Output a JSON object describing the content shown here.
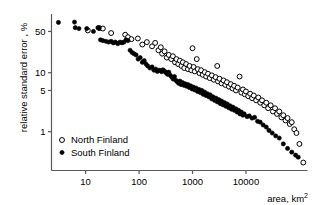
{
  "chart_data": {
    "type": "scatter",
    "title": "",
    "xlabel": "area, km2",
    "xlabel_display": "area, km²",
    "ylabel": "relative standard error , %",
    "xscale": "log",
    "yscale": "log",
    "xlim": [
      2.3,
      130000
    ],
    "ylim": [
      0.22,
      95
    ],
    "xticks": [
      10,
      100,
      1000,
      10000
    ],
    "xticklabels": [
      "10",
      "100",
      "1000",
      "10000"
    ],
    "yticks": [
      1,
      5,
      10,
      50
    ],
    "yticklabels": [
      "1",
      "5",
      "10",
      "50"
    ],
    "grid": false,
    "legend_position": "lower-left-inside",
    "series": [
      {
        "name": "North Finland",
        "marker": "open-circle",
        "color": "#000000",
        "fill": "#ffffff",
        "points": [
          [
            11,
            52
          ],
          [
            18,
            57
          ],
          [
            21,
            56
          ],
          [
            30,
            47
          ],
          [
            55,
            44
          ],
          [
            62,
            40
          ],
          [
            72,
            37
          ],
          [
            95,
            38
          ],
          [
            115,
            30
          ],
          [
            140,
            33
          ],
          [
            175,
            28
          ],
          [
            200,
            32
          ],
          [
            230,
            24
          ],
          [
            255,
            27
          ],
          [
            270,
            21
          ],
          [
            300,
            23
          ],
          [
            330,
            18
          ],
          [
            360,
            20
          ],
          [
            400,
            17
          ],
          [
            430,
            19
          ],
          [
            470,
            15
          ],
          [
            500,
            17
          ],
          [
            540,
            14
          ],
          [
            580,
            16
          ],
          [
            620,
            13
          ],
          [
            660,
            15
          ],
          [
            700,
            12
          ],
          [
            760,
            14
          ],
          [
            820,
            11.5
          ],
          [
            880,
            13
          ],
          [
            950,
            11
          ],
          [
            1000,
            26
          ],
          [
            1050,
            12.5
          ],
          [
            1100,
            10.5
          ],
          [
            1200,
            17
          ],
          [
            1250,
            11.5
          ],
          [
            1350,
            9.8
          ],
          [
            1450,
            11
          ],
          [
            1550,
            9.2
          ],
          [
            1700,
            10.2
          ],
          [
            1800,
            8.6
          ],
          [
            1950,
            9.6
          ],
          [
            2100,
            8.1
          ],
          [
            2300,
            9.0
          ],
          [
            2500,
            7.6
          ],
          [
            2700,
            8.4
          ],
          [
            2900,
            13
          ],
          [
            3000,
            7.1
          ],
          [
            3200,
            7.9
          ],
          [
            3500,
            6.6
          ],
          [
            3800,
            7.4
          ],
          [
            4100,
            6.2
          ],
          [
            4400,
            6.9
          ],
          [
            4800,
            5.8
          ],
          [
            5200,
            6.4
          ],
          [
            5600,
            5.4
          ],
          [
            6000,
            6.0
          ],
          [
            6500,
            5.0
          ],
          [
            7000,
            5.6
          ],
          [
            7600,
            8.6
          ],
          [
            8200,
            4.6
          ],
          [
            8800,
            5.2
          ],
          [
            9500,
            4.3
          ],
          [
            10000,
            4.8
          ],
          [
            11000,
            4.0
          ],
          [
            12000,
            4.4
          ],
          [
            13000,
            3.7
          ],
          [
            14000,
            4.1
          ],
          [
            15500,
            3.4
          ],
          [
            17000,
            3.8
          ],
          [
            18500,
            3.1
          ],
          [
            20000,
            3.4
          ],
          [
            22000,
            2.8
          ],
          [
            24000,
            3.1
          ],
          [
            26000,
            2.5
          ],
          [
            29000,
            2.8
          ],
          [
            32000,
            2.2
          ],
          [
            35000,
            2.5
          ],
          [
            38000,
            2.0
          ],
          [
            42000,
            2.2
          ],
          [
            46000,
            1.75
          ],
          [
            50000,
            1.9
          ],
          [
            55000,
            1.55
          ],
          [
            60000,
            1.7
          ],
          [
            66000,
            1.35
          ],
          [
            72000,
            1.45
          ],
          [
            80000,
            1.1
          ],
          [
            88000,
            0.95
          ],
          [
            100000,
            0.62
          ],
          [
            118000,
            0.3
          ]
        ]
      },
      {
        "name": "South Finland",
        "marker": "filled-circle",
        "color": "#000000",
        "fill": "#000000",
        "points": [
          [
            3.1,
            71
          ],
          [
            6.2,
            72
          ],
          [
            6.4,
            58
          ],
          [
            7.5,
            56
          ],
          [
            10.5,
            56
          ],
          [
            14,
            50
          ],
          [
            17,
            58
          ],
          [
            18,
            57
          ],
          [
            19,
            36
          ],
          [
            21,
            35
          ],
          [
            24,
            34
          ],
          [
            27,
            33
          ],
          [
            30,
            34
          ],
          [
            33,
            32
          ],
          [
            36,
            33
          ],
          [
            40,
            31
          ],
          [
            44,
            33
          ],
          [
            48,
            32
          ],
          [
            52,
            33
          ],
          [
            57,
            36
          ],
          [
            62,
            35
          ],
          [
            68,
            24
          ],
          [
            74,
            22
          ],
          [
            80,
            21
          ],
          [
            88,
            20
          ],
          [
            96,
            17
          ],
          [
            105,
            18
          ],
          [
            115,
            15
          ],
          [
            125,
            16
          ],
          [
            135,
            14
          ],
          [
            145,
            13
          ],
          [
            160,
            12
          ],
          [
            175,
            12.5
          ],
          [
            190,
            11
          ],
          [
            205,
            11.5
          ],
          [
            220,
            10.5
          ],
          [
            235,
            11
          ],
          [
            250,
            10.8
          ],
          [
            265,
            10.4
          ],
          [
            280,
            11.2
          ],
          [
            300,
            10.6
          ],
          [
            320,
            10.0
          ],
          [
            340,
            9.4
          ],
          [
            360,
            10.2
          ],
          [
            385,
            9.0
          ],
          [
            410,
            8.4
          ],
          [
            435,
            7.8
          ],
          [
            460,
            8.6
          ],
          [
            490,
            7.4
          ],
          [
            520,
            7.0
          ],
          [
            550,
            6.6
          ],
          [
            580,
            7.2
          ],
          [
            610,
            6.3
          ],
          [
            650,
            6.8
          ],
          [
            690,
            6.1
          ],
          [
            730,
            6.5
          ],
          [
            770,
            5.9
          ],
          [
            820,
            6.3
          ],
          [
            870,
            5.6
          ],
          [
            920,
            6.0
          ],
          [
            980,
            5.3
          ],
          [
            1040,
            5.7
          ],
          [
            1100,
            5.1
          ],
          [
            1170,
            5.5
          ],
          [
            1240,
            4.8
          ],
          [
            1320,
            5.2
          ],
          [
            1400,
            4.6
          ],
          [
            1490,
            5.0
          ],
          [
            1580,
            4.3
          ],
          [
            1680,
            4.7
          ],
          [
            1790,
            4.1
          ],
          [
            1900,
            4.4
          ],
          [
            2020,
            3.9
          ],
          [
            2150,
            4.2
          ],
          [
            2280,
            3.6
          ],
          [
            2420,
            3.9
          ],
          [
            2580,
            3.4
          ],
          [
            2740,
            3.7
          ],
          [
            2910,
            3.2
          ],
          [
            3100,
            3.5
          ],
          [
            3300,
            3.0
          ],
          [
            3500,
            3.3
          ],
          [
            3720,
            2.85
          ],
          [
            3960,
            3.1
          ],
          [
            4200,
            2.7
          ],
          [
            4470,
            2.95
          ],
          [
            4750,
            2.55
          ],
          [
            5050,
            2.75
          ],
          [
            5370,
            2.4
          ],
          [
            5700,
            2.6
          ],
          [
            6060,
            2.3
          ],
          [
            6450,
            2.45
          ],
          [
            6850,
            2.15
          ],
          [
            7280,
            2.3
          ],
          [
            7740,
            2.0
          ],
          [
            8230,
            2.15
          ],
          [
            8750,
            1.9
          ],
          [
            9300,
            2.0
          ],
          [
            10500,
            1.8
          ],
          [
            11500,
            1.85
          ],
          [
            13000,
            1.7
          ],
          [
            14500,
            1.75
          ],
          [
            16500,
            1.5
          ],
          [
            18500,
            1.45
          ],
          [
            21000,
            1.3
          ],
          [
            24000,
            1.2
          ],
          [
            27000,
            1.05
          ],
          [
            31000,
            0.95
          ],
          [
            36000,
            0.85
          ],
          [
            42000,
            0.78
          ],
          [
            50000,
            0.62
          ],
          [
            60000,
            0.52
          ],
          [
            72000,
            0.45
          ],
          [
            85000,
            0.4
          ],
          [
            95000,
            0.37
          ]
        ]
      }
    ]
  },
  "axes": {
    "x_tick_labels": [
      "10",
      "100",
      "1000",
      "10000"
    ],
    "y_tick_labels": [
      "50",
      "10",
      "5",
      "1"
    ],
    "y_axis_title": "relative standard error , %",
    "x_axis_title_prefix": "area, km",
    "x_axis_title_sup": "2"
  },
  "legend": {
    "entries": [
      {
        "label": "North Finland",
        "marker": "open-circle"
      },
      {
        "label": "South Finland",
        "marker": "filled-circle"
      }
    ]
  },
  "style": {
    "axis_color": "#5a5a5a",
    "marker_color": "#000000",
    "background": "#ffffff"
  }
}
